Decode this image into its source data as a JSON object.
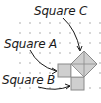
{
  "diagram": {
    "labels": {
      "square_c": "Square C",
      "square_a": "Square A",
      "square_b": "Square B"
    },
    "colors": {
      "square_fill": "#cfcfcf",
      "square_stroke": "#8a8a8a",
      "dot": "#c4c4c4",
      "arrow": "#1a1a1a",
      "text": "#1a1a1a"
    },
    "grid": {
      "spacing_px": 10,
      "style": "dot grid"
    },
    "shapes": [
      {
        "name": "Square A",
        "type": "square",
        "position": "left leg of right triangle"
      },
      {
        "name": "Square B",
        "type": "square",
        "position": "bottom leg of right triangle"
      },
      {
        "name": "Square C",
        "type": "square",
        "position": "hypotenuse (rotated 45°, with diagonals)"
      }
    ]
  }
}
